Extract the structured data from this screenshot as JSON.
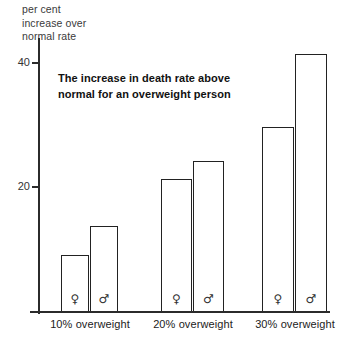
{
  "chart_data": {
    "type": "bar",
    "title": "The increase in death rate above normal for an overweight person",
    "title_lines": [
      "The increase in death rate above",
      "normal for an overweight person"
    ],
    "ylabel": "per cent increase over normal rate",
    "ylabel_lines": [
      "per cent",
      "increase over",
      "normal rate"
    ],
    "xlabel": "",
    "categories": [
      "10% overweight",
      "20% overweight",
      "30% overweight"
    ],
    "series": [
      {
        "name": "female",
        "symbol": "♀",
        "values": [
          9,
          21.3,
          29.7
        ]
      },
      {
        "name": "male",
        "symbol": "♂",
        "values": [
          13.7,
          24.2,
          41.4
        ]
      }
    ],
    "ylim": [
      0,
      45
    ],
    "yticks": [
      20,
      40
    ],
    "ytick_labels": [
      "20",
      "40"
    ],
    "grid": false,
    "legend": "inline-symbols",
    "bar_fill": "#ffffff",
    "bar_stroke": "#222222",
    "axis_color": "#2b2b2b",
    "background": "#ffffff"
  }
}
